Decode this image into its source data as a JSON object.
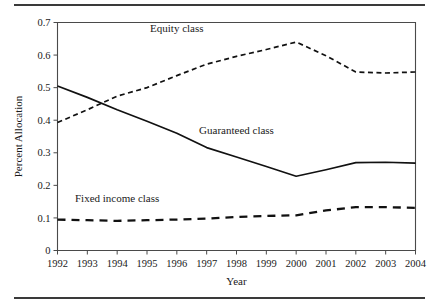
{
  "figure": {
    "has_top_rule": true,
    "has_bottom_rule": true,
    "background_color": "#ffffff",
    "line_color": "#111111"
  },
  "axes": {
    "y_title": "Percent Allocation",
    "x_title": "Year",
    "y_ticks": [
      "0",
      "0.1",
      "0.2",
      "0.3",
      "0.4",
      "0.5",
      "0.6",
      "0.7"
    ],
    "x_ticks": [
      "1992",
      "1993",
      "1994",
      "1995",
      "1996",
      "1997",
      "1998",
      "1999",
      "2000",
      "2001",
      "2002",
      "2003",
      "2004"
    ]
  },
  "series_labels": {
    "equity": "Equity class",
    "guaranteed": "Guaranteed class",
    "fixed_income": "Fixed income class"
  },
  "chart_data": {
    "type": "line",
    "title": "",
    "subtitle": "",
    "xlabel": "Year",
    "ylabel": "Percent Allocation",
    "xlim": [
      1992,
      2004
    ],
    "ylim": [
      0,
      0.7
    ],
    "ytick_step": 0.1,
    "grid": false,
    "legend_position": "inline-annotations",
    "x": [
      1992,
      1993,
      1994,
      1995,
      1996,
      1997,
      1998,
      1999,
      2000,
      2001,
      2002,
      2003,
      2004
    ],
    "series": [
      {
        "name": "Equity class",
        "style": "dashed-fine",
        "color": "#111111",
        "values": [
          0.393,
          0.432,
          0.474,
          0.5,
          0.537,
          0.572,
          0.596,
          0.617,
          0.64,
          0.598,
          0.548,
          0.545,
          0.548
        ]
      },
      {
        "name": "Guaranteed class",
        "style": "solid",
        "color": "#111111",
        "values": [
          0.505,
          0.47,
          0.432,
          0.397,
          0.36,
          0.316,
          0.287,
          0.258,
          0.228,
          0.248,
          0.27,
          0.271,
          0.268
        ]
      },
      {
        "name": "Fixed income class",
        "style": "dashed-coarse",
        "color": "#111111",
        "values": [
          0.095,
          0.093,
          0.091,
          0.093,
          0.095,
          0.098,
          0.103,
          0.106,
          0.108,
          0.123,
          0.133,
          0.133,
          0.131
        ]
      }
    ],
    "annotations": [
      {
        "text": "Equity class",
        "x": 1996.0,
        "y": 0.672
      },
      {
        "text": "Guaranteed class",
        "x": 1998.0,
        "y": 0.358
      },
      {
        "text": "Fixed income class",
        "x": 1994.0,
        "y": 0.15
      }
    ]
  }
}
